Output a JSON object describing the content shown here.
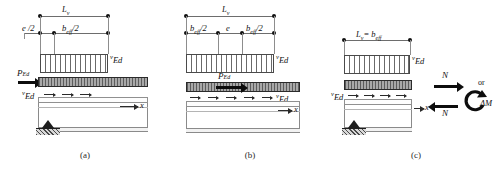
{
  "figure": {
    "panels": [
      {
        "id": "a",
        "caption": "(a)",
        "dimensions": [
          {
            "name": "Lv",
            "label": "L",
            "sub": "v",
            "full": "L_v"
          },
          {
            "name": "e-half",
            "label": "e /2",
            "full": "e /2"
          },
          {
            "name": "beff-half",
            "label": "b",
            "sub": "eff",
            "suffix": "/2",
            "full": "b_eff/2"
          }
        ],
        "load_label": {
          "sup": "v",
          "base": "Ed",
          "full": "vEd"
        },
        "force_label": {
          "base": "P",
          "sub": "Ed",
          "full": "P_Ed"
        },
        "shear_label": {
          "sup": "v",
          "base": "Ed",
          "full": "vEd"
        },
        "axis_label": "x"
      },
      {
        "id": "b",
        "caption": "(b)",
        "dimensions": [
          {
            "name": "Lv",
            "label": "L",
            "sub": "v",
            "full": "L_v"
          },
          {
            "name": "beff-half-left",
            "label": "b",
            "sub": "eff",
            "suffix": "/2",
            "full": "b_eff/2"
          },
          {
            "name": "e",
            "label": "e",
            "full": "e"
          },
          {
            "name": "beff-half-right",
            "label": "b",
            "sub": "eff",
            "suffix": "/2",
            "full": "b_eff/2"
          }
        ],
        "load_label": {
          "sup": "v",
          "base": "Ed",
          "full": "vEd"
        },
        "force_label": {
          "base": "P",
          "sub": "Ed",
          "full": "P_Ed"
        },
        "shear_label": {
          "sup": "v",
          "base": "Ed",
          "full": "vEd"
        },
        "axis_label": "x"
      },
      {
        "id": "c",
        "caption": "(c)",
        "dimensions": [
          {
            "name": "Lv-eq-beff",
            "label": "L",
            "sub": "v",
            "eq": " = ",
            "label2": "b",
            "sub2": "eff",
            "full": "L_v = b_eff"
          }
        ],
        "load_label": {
          "sup": "v",
          "base": "Ed",
          "full": "vEd"
        },
        "shear_label": {
          "sup": "v",
          "base": "Ed",
          "full": "vEd"
        },
        "axis_label": "x",
        "axial_top_label": "N",
        "axial_bottom_label": "N",
        "or_label": "or",
        "moment_label": "ΔM"
      }
    ]
  },
  "colors": {
    "ink": "#111111",
    "line": "#6d6d6d",
    "slab_dark": "#5c5c5c",
    "slab_light": "#a8a8a8",
    "arrow": "#0d0d0d",
    "support": "#1d1d1d",
    "background": "#ffffff"
  }
}
